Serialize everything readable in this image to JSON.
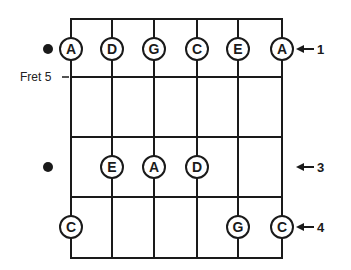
{
  "diagram": {
    "type": "fretboard",
    "fret_label": "Fret 5",
    "strings": 6,
    "rows": [
      {
        "row": 1,
        "has_dot": true,
        "finger": "1",
        "notes": [
          {
            "string": 1,
            "note": "A"
          },
          {
            "string": 2,
            "note": "D"
          },
          {
            "string": 3,
            "note": "G"
          },
          {
            "string": 4,
            "note": "C"
          },
          {
            "string": 5,
            "note": "E"
          },
          {
            "string": 6,
            "note": "A"
          }
        ]
      },
      {
        "row": 3,
        "has_dot": true,
        "finger": "3",
        "notes": [
          {
            "string": 2,
            "note": "E"
          },
          {
            "string": 3,
            "note": "A"
          },
          {
            "string": 4,
            "note": "D"
          }
        ]
      },
      {
        "row": 4,
        "has_dot": false,
        "finger": "4",
        "notes": [
          {
            "string": 1,
            "note": "C"
          },
          {
            "string": 5,
            "note": "G"
          },
          {
            "string": 6,
            "note": "C"
          }
        ]
      }
    ],
    "colors": {
      "ink": "#1a1a1a",
      "background": "#ffffff"
    }
  }
}
